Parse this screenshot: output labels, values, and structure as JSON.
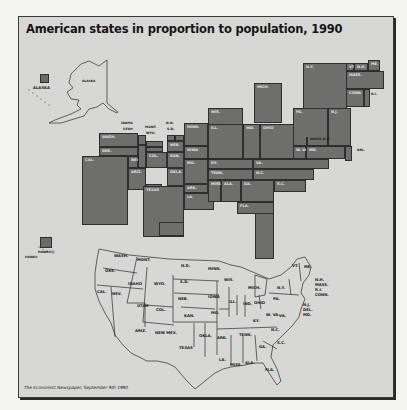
{
  "title": "American states in proportion to population, 1990",
  "credit": "The Economist Newspaper, September 9th 1990",
  "colors": {
    "background": "#d7d7d5",
    "block_fill": "#6e6e6c",
    "block_border": "#2e2e2e",
    "outline_map": "#2a2a2a",
    "title_text": "#151515"
  },
  "insets": {
    "alaska": {
      "square_label": "ALASKA",
      "map_label": "ALASKA"
    },
    "hawaii": {
      "square_label": "HAWAII",
      "map_label": "HAWAII"
    }
  },
  "cartogram": {
    "blocks": [
      {
        "id": "ny",
        "label": "N.Y.",
        "x": 284,
        "y": 46,
        "w": 44,
        "h": 46
      },
      {
        "id": "vt",
        "label": "VT.",
        "x": 327,
        "y": 46,
        "w": 8,
        "h": 8
      },
      {
        "id": "nh",
        "label": "N.H.",
        "x": 335,
        "y": 46,
        "w": 14,
        "h": 8
      },
      {
        "id": "me",
        "label": "ME.",
        "x": 349,
        "y": 43,
        "w": 12,
        "h": 11
      },
      {
        "id": "mass",
        "label": "MASS.",
        "x": 327,
        "y": 54,
        "w": 38,
        "h": 18
      },
      {
        "id": "conn",
        "label": "CONN.",
        "x": 327,
        "y": 72,
        "w": 18,
        "h": 18
      },
      {
        "id": "ri",
        "label": "",
        "x": 345,
        "y": 72,
        "w": 6,
        "h": 18
      },
      {
        "id": "mich",
        "label": "MICH.",
        "x": 235,
        "y": 66,
        "w": 28,
        "h": 40
      },
      {
        "id": "wis",
        "label": "WIS.",
        "x": 189,
        "y": 91,
        "w": 35,
        "h": 17
      },
      {
        "id": "pa",
        "label": "PA.",
        "x": 274,
        "y": 91,
        "w": 35,
        "h": 38
      },
      {
        "id": "nj",
        "label": "N.J.",
        "x": 309,
        "y": 91,
        "w": 23,
        "h": 38
      },
      {
        "id": "ill",
        "label": "ILL.",
        "x": 189,
        "y": 107,
        "w": 35,
        "h": 35
      },
      {
        "id": "ind",
        "label": "IND.",
        "x": 224,
        "y": 107,
        "w": 17,
        "h": 35
      },
      {
        "id": "ohio",
        "label": "OHIO",
        "x": 241,
        "y": 107,
        "w": 34,
        "h": 35
      },
      {
        "id": "wva",
        "label": "W. VA.",
        "x": 274,
        "y": 129,
        "w": 13,
        "h": 13
      },
      {
        "id": "dc",
        "label": "",
        "x": 287,
        "y": 120,
        "w": 1,
        "h": 9
      },
      {
        "id": "md",
        "label": "MD.",
        "x": 287,
        "y": 129,
        "w": 39,
        "h": 13
      },
      {
        "id": "del",
        "label": "",
        "x": 326,
        "y": 129,
        "w": 7,
        "h": 15
      },
      {
        "id": "minn",
        "label": "MINN.",
        "x": 165,
        "y": 106,
        "w": 24,
        "h": 23
      },
      {
        "id": "iowa",
        "label": "IOWA",
        "x": 165,
        "y": 129,
        "w": 24,
        "h": 13
      },
      {
        "id": "mo",
        "label": "MO.",
        "x": 165,
        "y": 142,
        "w": 24,
        "h": 25
      },
      {
        "id": "ky",
        "label": "KY.",
        "x": 189,
        "y": 142,
        "w": 45,
        "h": 10
      },
      {
        "id": "va",
        "label": "VA.",
        "x": 234,
        "y": 142,
        "w": 76,
        "h": 10
      },
      {
        "id": "tenn",
        "label": "TENN.",
        "x": 189,
        "y": 152,
        "w": 45,
        "h": 11
      },
      {
        "id": "nc",
        "label": "N.C.",
        "x": 234,
        "y": 152,
        "w": 61,
        "h": 11
      },
      {
        "id": "ark",
        "label": "ARK.",
        "x": 165,
        "y": 167,
        "w": 24,
        "h": 9
      },
      {
        "id": "la",
        "label": "LA.",
        "x": 165,
        "y": 176,
        "w": 30,
        "h": 17
      },
      {
        "id": "miss",
        "label": "MISS.",
        "x": 189,
        "y": 163,
        "w": 13,
        "h": 22
      },
      {
        "id": "ala",
        "label": "ALA.",
        "x": 202,
        "y": 163,
        "w": 20,
        "h": 22
      },
      {
        "id": "ga",
        "label": "GA.",
        "x": 222,
        "y": 163,
        "w": 33,
        "h": 22
      },
      {
        "id": "sc",
        "label": "S.C.",
        "x": 255,
        "y": 163,
        "w": 32,
        "h": 12
      },
      {
        "id": "fla-top",
        "label": "FLA.",
        "x": 218,
        "y": 185,
        "w": 37,
        "h": 12
      },
      {
        "id": "fla-tail",
        "label": "",
        "x": 236,
        "y": 196,
        "w": 19,
        "h": 46
      },
      {
        "id": "wash",
        "label": "WASH.",
        "x": 80,
        "y": 116,
        "w": 39,
        "h": 14
      },
      {
        "id": "ore",
        "label": "ORE.",
        "x": 80,
        "y": 130,
        "w": 39,
        "h": 9
      },
      {
        "id": "cal",
        "label": "CAL.",
        "x": 63,
        "y": 139,
        "w": 46,
        "h": 69
      },
      {
        "id": "nev",
        "label": "NEV.",
        "x": 109,
        "y": 139,
        "w": 10,
        "h": 12
      },
      {
        "id": "idaho",
        "label": "",
        "x": 119,
        "y": 118,
        "w": 8,
        "h": 10
      },
      {
        "id": "utah",
        "label": "",
        "x": 119,
        "y": 128,
        "w": 8,
        "h": 23
      },
      {
        "id": "mont",
        "label": "",
        "x": 127,
        "y": 124,
        "w": 17,
        "h": 6
      },
      {
        "id": "wyo",
        "label": "",
        "x": 127,
        "y": 130,
        "w": 17,
        "h": 5
      },
      {
        "id": "ariz",
        "label": "ARIZ.",
        "x": 109,
        "y": 151,
        "w": 18,
        "h": 22
      },
      {
        "id": "col",
        "label": "COL.",
        "x": 127,
        "y": 135,
        "w": 21,
        "h": 16
      },
      {
        "id": "nd",
        "label": "",
        "x": 148,
        "y": 118,
        "w": 8,
        "h": 6
      },
      {
        "id": "sd",
        "label": "",
        "x": 156,
        "y": 118,
        "w": 9,
        "h": 6
      },
      {
        "id": "neb",
        "label": "NEB.",
        "x": 148,
        "y": 124,
        "w": 17,
        "h": 11
      },
      {
        "id": "kan",
        "label": "KAN.",
        "x": 148,
        "y": 135,
        "w": 17,
        "h": 16
      },
      {
        "id": "okla",
        "label": "OKLA.",
        "x": 148,
        "y": 151,
        "w": 17,
        "h": 18
      },
      {
        "id": "newmex",
        "label": "NEW MEX.",
        "x": 127,
        "y": 167,
        "w": 16,
        "h": 15
      },
      {
        "id": "texas",
        "label": "TEXAS",
        "x": 124,
        "y": 169,
        "w": 41,
        "h": 51
      },
      {
        "id": "texas-low",
        "label": "",
        "x": 140,
        "y": 205,
        "w": 25,
        "h": 14
      }
    ],
    "callouts": [
      {
        "label": "IDAHO",
        "x": 102,
        "y": 104
      },
      {
        "label": "UTAH",
        "x": 104,
        "y": 110
      },
      {
        "label": "MONT.",
        "x": 126,
        "y": 108
      },
      {
        "label": "WYO.",
        "x": 127,
        "y": 114
      },
      {
        "label": "N.D.",
        "x": 147,
        "y": 104
      },
      {
        "label": "S.D.",
        "x": 148,
        "y": 110
      },
      {
        "label": "WASH. D.C.",
        "x": 291,
        "y": 120
      },
      {
        "label": "DEL.",
        "x": 338,
        "y": 131
      },
      {
        "label": "R.I.",
        "x": 352,
        "y": 75
      }
    ]
  },
  "reference_map": {
    "labels": [
      {
        "label": "WASH.",
        "x": 95,
        "y": 236
      },
      {
        "label": "MONT.",
        "x": 118,
        "y": 240
      },
      {
        "label": "N.D.",
        "x": 162,
        "y": 246
      },
      {
        "label": "MINN.",
        "x": 189,
        "y": 249
      },
      {
        "label": "ORE.",
        "x": 86,
        "y": 251
      },
      {
        "label": "S.D.",
        "x": 161,
        "y": 262
      },
      {
        "label": "WIS.",
        "x": 205,
        "y": 260
      },
      {
        "label": "IDAHO",
        "x": 109,
        "y": 264
      },
      {
        "label": "WYO.",
        "x": 135,
        "y": 264
      },
      {
        "label": "MICH.",
        "x": 229,
        "y": 268
      },
      {
        "label": "VT.",
        "x": 273,
        "y": 246
      },
      {
        "label": "ME.",
        "x": 285,
        "y": 247
      },
      {
        "label": "N.H.",
        "x": 296,
        "y": 260
      },
      {
        "label": "MASS.",
        "x": 296,
        "y": 265
      },
      {
        "label": "R.I.",
        "x": 296,
        "y": 270
      },
      {
        "label": "CONN.",
        "x": 296,
        "y": 275
      },
      {
        "label": "N.Y.",
        "x": 258,
        "y": 268
      },
      {
        "label": "CAL.",
        "x": 78,
        "y": 272
      },
      {
        "label": "NEV.",
        "x": 93,
        "y": 274
      },
      {
        "label": "NEB.",
        "x": 159,
        "y": 279
      },
      {
        "label": "IOWA",
        "x": 189,
        "y": 277
      },
      {
        "label": "ILL.",
        "x": 210,
        "y": 282
      },
      {
        "label": "IND.",
        "x": 224,
        "y": 284
      },
      {
        "label": "OHIO",
        "x": 235,
        "y": 283
      },
      {
        "label": "PA.",
        "x": 254,
        "y": 279
      },
      {
        "label": "N.J.",
        "x": 284,
        "y": 285
      },
      {
        "label": "DEL.",
        "x": 284,
        "y": 290
      },
      {
        "label": "MD.",
        "x": 284,
        "y": 295
      },
      {
        "label": "UTAH",
        "x": 118,
        "y": 286
      },
      {
        "label": "COL.",
        "x": 137,
        "y": 290
      },
      {
        "label": "MO.",
        "x": 192,
        "y": 293
      },
      {
        "label": "KAN.",
        "x": 165,
        "y": 296
      },
      {
        "label": "W. VA.",
        "x": 247,
        "y": 295
      },
      {
        "label": "VA.",
        "x": 260,
        "y": 296
      },
      {
        "label": "KY.",
        "x": 234,
        "y": 301
      },
      {
        "label": "N.C.",
        "x": 252,
        "y": 310
      },
      {
        "label": "ARIZ.",
        "x": 116,
        "y": 311
      },
      {
        "label": "NEW MEX.",
        "x": 136,
        "y": 313
      },
      {
        "label": "OKLA.",
        "x": 180,
        "y": 316
      },
      {
        "label": "ARK.",
        "x": 198,
        "y": 318
      },
      {
        "label": "TENN.",
        "x": 220,
        "y": 315
      },
      {
        "label": "S.C.",
        "x": 258,
        "y": 323
      },
      {
        "label": "GA.",
        "x": 240,
        "y": 327
      },
      {
        "label": "TEXAS",
        "x": 160,
        "y": 328
      },
      {
        "label": "LA.",
        "x": 200,
        "y": 340
      },
      {
        "label": "MISS.",
        "x": 211,
        "y": 345
      },
      {
        "label": "ALA.",
        "x": 226,
        "y": 343
      },
      {
        "label": "FLA.",
        "x": 246,
        "y": 350
      }
    ]
  }
}
